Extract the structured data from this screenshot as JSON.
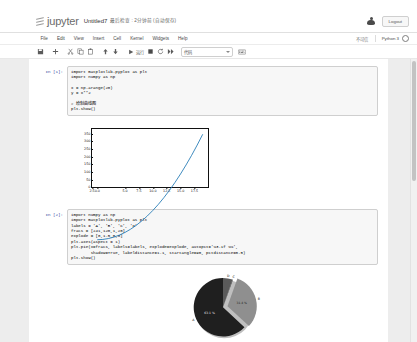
{
  "header": {
    "logo_text": "jupyter",
    "notebook_title": "Untitled7",
    "notebook_subtitle": "最后检查 : 2分钟前 (自动保存)",
    "logout_label": "Logout",
    "user_icon": "user-icon"
  },
  "menubar": {
    "items": [
      {
        "label": "File"
      },
      {
        "label": "Edit"
      },
      {
        "label": "View"
      },
      {
        "label": "Insert"
      },
      {
        "label": "Cell"
      },
      {
        "label": "Kernel"
      },
      {
        "label": "Widgets"
      },
      {
        "label": "Help"
      }
    ],
    "trusted_label": "不可信",
    "kernel_name": "Python 3",
    "kernel_status": "idle-circle"
  },
  "toolbar": {
    "save_title": "save-icon",
    "add_title": "plus-icon",
    "cut_title": "scissors-icon",
    "copy_title": "copy-icon",
    "paste_title": "paste-icon",
    "move_up_title": "arrow-up-icon",
    "move_down_title": "arrow-down-icon",
    "run_label": "运行",
    "stop_title": "stop-icon",
    "restart_title": "restart-icon",
    "restart_run_all_title": "fast-forward-icon",
    "cell_type": "代码",
    "keyboard_title": "keyboard-icon"
  },
  "cells": [
    {
      "prompt": "In [1]:",
      "source": "import matplotlib.pyplot as plt\nimport numpy as np\n\nx = np.arange(20)\ny = x**2\n\n# 绘制曲线图\nplt.show()",
      "output_type": "line-plot"
    },
    {
      "prompt": "In [2]:",
      "source": "import numpy as np\nimport matplotlib.pyplot as plt\nlabels = 'A', 'B', 'C', 'D'\nfracs = [241,120,1,20]\nexplode = [0,1.5,0,0]\nplt.axes(aspect = 1)\nplt.pie(x=fracs, labels=labels, explode=explode, autopct='%3.1f %%',\n        shadow=True, labeldistance=1.1, startangle=90, pctdistance=0.5)\nplt.show()",
      "output_type": "pie-chart"
    }
  ],
  "chart_data": [
    {
      "type": "line",
      "title": "",
      "xlabel": "",
      "ylabel": "",
      "x": [
        0,
        1,
        2,
        3,
        4,
        5,
        6,
        7,
        8,
        9,
        10,
        11,
        12,
        13,
        14,
        15,
        16,
        17,
        18,
        19
      ],
      "y": [
        0,
        1,
        4,
        9,
        16,
        25,
        36,
        49,
        64,
        81,
        100,
        121,
        144,
        169,
        196,
        225,
        256,
        289,
        324,
        361
      ],
      "xticks": [
        "0.0",
        "2.5",
        "5.0",
        "7.5",
        "10.0",
        "12.5",
        "15.0",
        "17.5"
      ],
      "xtickvals": [
        0,
        2.5,
        5,
        7.5,
        10,
        12.5,
        15,
        17.5
      ],
      "yticks": [
        "0",
        "50",
        "100",
        "150",
        "200",
        "250",
        "300",
        "350"
      ],
      "ytickvals": [
        0,
        50,
        100,
        150,
        200,
        250,
        300,
        350
      ],
      "xlim": [
        -0.95,
        19.95
      ],
      "ylim": [
        -18.05,
        379.05
      ],
      "grid": false,
      "legend": "none",
      "line_color": "#1f77b4"
    },
    {
      "type": "pie",
      "title": "",
      "labels": [
        "A",
        "B",
        "C",
        "D"
      ],
      "values": [
        241,
        120,
        1,
        20
      ],
      "percents": [
        "63.1 %",
        "31.4 %",
        "0.3 %",
        "5.2 %"
      ],
      "explode": [
        0,
        1.5,
        0,
        0
      ],
      "startangle": 90,
      "shadow": true,
      "labeldistance": 1.1,
      "pctdistance": 0.5,
      "colors": [
        "#1f1f1f",
        "#8f8f8f",
        "#3a3a3a",
        "#5a5a5a"
      ],
      "legend": "none"
    }
  ]
}
